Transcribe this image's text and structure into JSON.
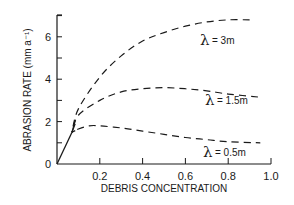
{
  "chart_data": {
    "type": "line",
    "title": "",
    "xlabel": "DEBRIS CONCENTRATION",
    "ylabel": "ABRASION RATE (mm a⁻¹)",
    "xlim": [
      0,
      1.0
    ],
    "ylim": [
      0,
      7
    ],
    "xticks": [
      "0.2",
      "0.4",
      "0.6",
      "0.8",
      "1.0"
    ],
    "yticks": [
      "0",
      "2",
      "4",
      "6"
    ],
    "grid": false,
    "legend": "inline labels",
    "initial_solid_segment": {
      "x": [
        0,
        0.07
      ],
      "y": [
        0,
        1.5
      ]
    },
    "series": [
      {
        "name": "λ = 3m",
        "lambda_symbol": "λ",
        "label_text": "= 3m",
        "style": "dashed",
        "x": [
          0.07,
          0.1,
          0.2,
          0.3,
          0.4,
          0.5,
          0.6,
          0.7,
          0.8,
          0.9
        ],
        "y": [
          1.5,
          2.6,
          4.1,
          5.1,
          5.8,
          6.2,
          6.5,
          6.7,
          6.8,
          6.8
        ]
      },
      {
        "name": "λ = 1.5m",
        "lambda_symbol": "λ",
        "label_text": "= 1.5m",
        "style": "dashed",
        "x": [
          0.07,
          0.1,
          0.2,
          0.3,
          0.4,
          0.5,
          0.6,
          0.7,
          0.8,
          0.95
        ],
        "y": [
          1.5,
          2.3,
          3.0,
          3.4,
          3.55,
          3.6,
          3.55,
          3.45,
          3.3,
          3.15
        ]
      },
      {
        "name": "λ = 0.5m",
        "lambda_symbol": "λ",
        "label_text": "= 0.5m",
        "style": "dashed",
        "x": [
          0.07,
          0.1,
          0.15,
          0.2,
          0.3,
          0.4,
          0.5,
          0.6,
          0.7,
          0.8,
          0.95
        ],
        "y": [
          1.5,
          1.65,
          1.8,
          1.8,
          1.7,
          1.55,
          1.4,
          1.25,
          1.15,
          1.05,
          1.0
        ]
      }
    ]
  },
  "colors": {
    "ink": "#1a1a1a",
    "background": "#ffffff"
  }
}
